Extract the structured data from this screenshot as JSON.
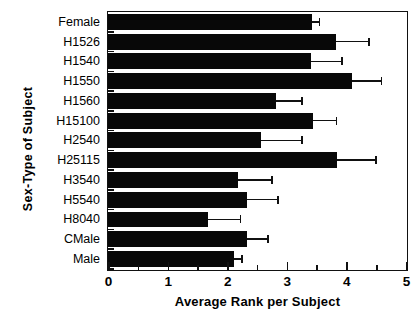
{
  "chart_data": {
    "type": "bar",
    "orientation": "horizontal",
    "title": "",
    "xlabel": "Average Rank  per Subject",
    "ylabel": "Sex-Type  of  Subject",
    "xlim": [
      0,
      5
    ],
    "xticks": [
      0,
      1,
      2,
      3,
      4,
      5
    ],
    "xtick_labels": [
      "0",
      "1",
      "2",
      "3",
      "4",
      "5"
    ],
    "minor_xticks": [
      0.5,
      1.5,
      2.5,
      3.5,
      4.5
    ],
    "grid": false,
    "legend": false,
    "bar_color": "#080808",
    "frame_color": "#111111",
    "categories": [
      "Female",
      "H1526",
      "H1540",
      "H1550",
      "H1560",
      "H15100",
      "H2540",
      "H25115",
      "H3540",
      "H5540",
      "H8040",
      "CMale",
      "Male"
    ],
    "values": [
      3.42,
      3.82,
      3.4,
      4.1,
      2.82,
      3.44,
      2.57,
      3.85,
      2.18,
      2.33,
      1.68,
      2.34,
      2.12
    ],
    "errors": [
      0.12,
      0.55,
      0.52,
      0.48,
      0.42,
      0.38,
      0.67,
      0.64,
      0.56,
      0.51,
      0.53,
      0.33,
      0.12
    ],
    "error_upper": [
      3.54,
      4.37,
      3.92,
      4.58,
      3.24,
      3.82,
      3.24,
      4.49,
      2.74,
      2.84,
      2.21,
      2.67,
      2.24
    ]
  }
}
